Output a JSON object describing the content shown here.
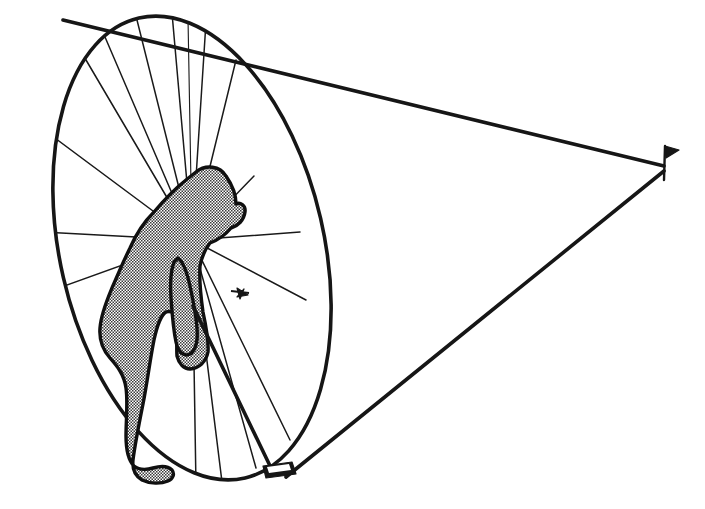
{
  "illustration": {
    "title": "Golfer putting alignment cone diagram",
    "style": "black-and-white patent line drawing with halftone stipple shading",
    "background_color": "#ffffff",
    "ink_color": "#161616",
    "canvas": {
      "width": 705,
      "height": 509
    }
  },
  "elements": {
    "golfer": {
      "label": "golfer-silhouette",
      "description": "Person bent forward over a putter, viewed from behind-left, shaded with fine halftone stipple dots",
      "fill": "halftone-stipple",
      "outline_color": "#101010",
      "posture": "addressing the ball, head down, arms hanging to grip"
    },
    "vision_cone": {
      "label": "vision-cone",
      "description": "Cone of sight / aim spreading from the distant flagstick back to the elliptical base plane",
      "apex_x": 665,
      "apex_y": 168,
      "upper_edge_from": [
        63,
        20
      ],
      "lower_edge_from": [
        286,
        477
      ]
    },
    "base_ellipse": {
      "label": "base-ellipse",
      "description": "Tilted elliptical cross-section of the cone standing vertically behind the golfer",
      "center_x": 192,
      "center_y": 248,
      "radius_x": 132,
      "radius_y": 236,
      "rotation_deg": -13
    },
    "radiating_spokes": {
      "label": "radiating-spokes",
      "description": "Straight sight lines converging at the golfer's eye point on the base ellipse",
      "convergence_x": 192,
      "convergence_y": 240,
      "count": 15
    },
    "golf_ball": {
      "label": "golf-ball-marker",
      "description": "Small asterisk / star glyph marking the ball position on the ellipse plane",
      "x": 240,
      "y": 293
    },
    "putter": {
      "label": "putter-club",
      "description": "Putter shaft angling down-right from the golfer's hands to a small rectangular club head",
      "shaft_from": [
        196,
        305
      ],
      "shaft_to": [
        272,
        472
      ],
      "head_x": 277,
      "head_y": 473
    },
    "flagstick": {
      "label": "flagstick-marker",
      "description": "Small pin with a triangular flag marking the hole at the cone apex",
      "x": 665,
      "y": 168
    }
  },
  "legend": {
    "figure_caption": "",
    "annotations": []
  }
}
